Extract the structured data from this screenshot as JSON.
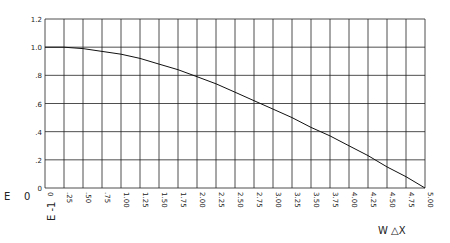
{
  "chart_data": {
    "type": "line",
    "title": "",
    "xlabel": "W △X",
    "ylabel": "E",
    "ylabel_extra": [
      "0",
      "E -1"
    ],
    "xlim": [
      0,
      5.0
    ],
    "ylim": [
      0,
      1.2
    ],
    "grid": true,
    "x_tick_labels": [
      "0",
      ".25",
      ".50",
      ".75",
      "1.00",
      "1.25",
      "1.50",
      "1.75",
      "2.00",
      "2.25",
      "2.50",
      "2.75",
      "3.00",
      "3.25",
      "3.50",
      "3.75",
      "4.00",
      "4.25",
      "4.50",
      "4.75",
      "5.00"
    ],
    "y_tick_labels": [
      "0",
      ".2",
      ".4",
      ".6",
      ".8",
      "1.0",
      "1.2"
    ],
    "x": [
      0,
      0.25,
      0.5,
      0.75,
      1.0,
      1.25,
      1.5,
      1.75,
      2.0,
      2.25,
      2.5,
      2.75,
      3.0,
      3.25,
      3.5,
      3.75,
      4.0,
      4.25,
      4.5,
      4.75,
      5.0
    ],
    "series": [
      {
        "name": "curve",
        "values": [
          1.0,
          1.0,
          0.99,
          0.97,
          0.95,
          0.92,
          0.88,
          0.84,
          0.79,
          0.74,
          0.68,
          0.62,
          0.56,
          0.5,
          0.43,
          0.37,
          0.3,
          0.23,
          0.15,
          0.08,
          0.0
        ]
      }
    ]
  }
}
